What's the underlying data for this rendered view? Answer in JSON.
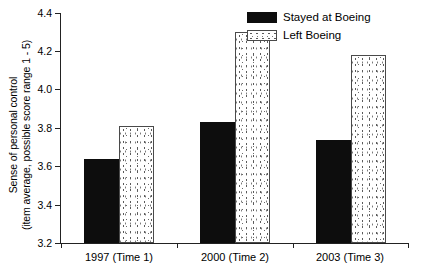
{
  "chart_data": {
    "type": "bar",
    "title": "",
    "subtitle": "",
    "xlabel": "",
    "ylabel": "Sense of personal control (item average, possible score range 1 - 5)",
    "ylabel_line1": "Sense of personal control",
    "ylabel_line2": "(item average, possible score range 1 - 5)",
    "categories": [
      "1997 (Time 1)",
      "2000 (Time 2)",
      "2003 (Time 3)"
    ],
    "series": [
      {
        "name": "Stayed at Boeing",
        "pattern": "solid-black",
        "color": "#0d0d0d",
        "values": [
          3.64,
          3.83,
          3.74
        ]
      },
      {
        "name": "Left Boeing",
        "pattern": "dotted-white",
        "color": "#ffffff",
        "values": [
          3.81,
          4.3,
          4.18
        ]
      }
    ],
    "ylim": [
      3.2,
      4.4
    ],
    "yticks": [
      3.2,
      3.4,
      3.6,
      3.8,
      4.0,
      4.2,
      4.4
    ],
    "ytick_labels": [
      "3.2",
      "3.4",
      "3.6",
      "3.8",
      "4.0",
      "4.2",
      "4.4"
    ],
    "grid": false,
    "legend_position": "top-right",
    "legend_entries": [
      "Stayed at Boeing",
      "Left Boeing"
    ]
  }
}
